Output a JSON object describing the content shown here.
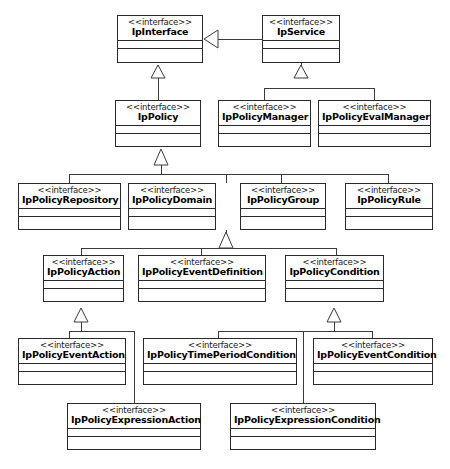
{
  "diagram": {
    "type": "uml-class-diagram",
    "stereotype_label": "<<interface>>",
    "line_color": "#3a3a3a",
    "fill_color": "#ffffff",
    "text_color": "#000000"
  },
  "classes": [
    {
      "id": "IpInterface",
      "name": "IpInterface",
      "stereotype": "<<interface>>",
      "x": 117,
      "y": 15,
      "w": 86,
      "h": 48
    },
    {
      "id": "IpService",
      "name": "IpService",
      "stereotype": "<<interface>>",
      "x": 262,
      "y": 15,
      "w": 78,
      "h": 48
    },
    {
      "id": "IpPolicy",
      "name": "IpPolicy",
      "stereotype": "<<interface>>",
      "x": 115,
      "y": 100,
      "w": 86,
      "h": 47
    },
    {
      "id": "IpPolicyManager",
      "name": "IpPolicyManager",
      "stereotype": "<<interface>>",
      "x": 218,
      "y": 100,
      "w": 93,
      "h": 47
    },
    {
      "id": "IpPolicyEvalManager",
      "name": "IpPolicyEvalManager",
      "stereotype": "<<interface>>",
      "x": 318,
      "y": 100,
      "w": 113,
      "h": 47
    },
    {
      "id": "IpPolicyRepository",
      "name": "IpPolicyRepository",
      "stereotype": "<<interface>>",
      "x": 18,
      "y": 183,
      "w": 103,
      "h": 47
    },
    {
      "id": "IpPolicyDomain",
      "name": "IpPolicyDomain",
      "stereotype": "<<interface>>",
      "x": 128,
      "y": 183,
      "w": 88,
      "h": 47
    },
    {
      "id": "IpPolicyGroup",
      "name": "IpPolicyGroup",
      "stereotype": "<<interface>>",
      "x": 240,
      "y": 183,
      "w": 86,
      "h": 47
    },
    {
      "id": "IpPolicyRule",
      "name": "IpPolicyRule",
      "stereotype": "<<interface>>",
      "x": 345,
      "y": 183,
      "w": 88,
      "h": 47
    },
    {
      "id": "IpPolicyAction",
      "name": "IpPolicyAction",
      "stereotype": "<<interface>>",
      "x": 43,
      "y": 255,
      "w": 81,
      "h": 47
    },
    {
      "id": "IpPolicyEventDefinition",
      "name": "IpPolicyEventDefinition",
      "stereotype": "<<interface>>",
      "x": 138,
      "y": 255,
      "w": 128,
      "h": 47
    },
    {
      "id": "IpPolicyCondition",
      "name": "IpPolicyCondition",
      "stereotype": "<<interface>>",
      "x": 285,
      "y": 255,
      "w": 99,
      "h": 47
    },
    {
      "id": "IpPolicyEventAction",
      "name": "IpPolicyEventAction",
      "stereotype": "<<interface>>",
      "x": 18,
      "y": 338,
      "w": 108,
      "h": 47
    },
    {
      "id": "IpPolicyTimePeriodCondition",
      "name": "IpPolicyTimePeriodCondition",
      "stereotype": "<<interface>>",
      "x": 143,
      "y": 338,
      "w": 154,
      "h": 47
    },
    {
      "id": "IpPolicyEventCondition",
      "name": "IpPolicyEventCondition",
      "stereotype": "<<interface>>",
      "x": 313,
      "y": 338,
      "w": 120,
      "h": 47
    },
    {
      "id": "IpPolicyExpressionAction",
      "name": "IpPolicyExpressionAction",
      "stereotype": "<<interface>>",
      "x": 67,
      "y": 403,
      "w": 134,
      "h": 47
    },
    {
      "id": "IpPolicyExpressionCondition",
      "name": "IpPolicyExpressionCondition",
      "stereotype": "<<interface>>",
      "x": 230,
      "y": 403,
      "w": 146,
      "h": 47
    }
  ],
  "generalizations": [
    {
      "from": "IpService",
      "to": "IpInterface",
      "kind": "generalization"
    },
    {
      "from": "IpPolicy",
      "to": "IpInterface",
      "kind": "generalization"
    },
    {
      "from": "IpPolicyManager",
      "to": "IpService",
      "kind": "generalization"
    },
    {
      "from": "IpPolicyEvalManager",
      "to": "IpService",
      "kind": "generalization"
    },
    {
      "from": "IpPolicyRepository",
      "to": "IpPolicy",
      "kind": "generalization"
    },
    {
      "from": "IpPolicyDomain",
      "to": "IpPolicy",
      "kind": "generalization"
    },
    {
      "from": "IpPolicyGroup",
      "to": "IpPolicy",
      "kind": "generalization"
    },
    {
      "from": "IpPolicyRule",
      "to": "IpPolicy",
      "kind": "generalization"
    },
    {
      "from": "IpPolicyAction",
      "to": "IpPolicyDomain",
      "kind": "generalization"
    },
    {
      "from": "IpPolicyEventDefinition",
      "to": "IpPolicyDomain",
      "kind": "generalization"
    },
    {
      "from": "IpPolicyCondition",
      "to": "IpPolicyDomain",
      "kind": "generalization"
    },
    {
      "from": "IpPolicyEventAction",
      "to": "IpPolicyAction",
      "kind": "generalization"
    },
    {
      "from": "IpPolicyExpressionAction",
      "to": "IpPolicyAction",
      "kind": "generalization"
    },
    {
      "from": "IpPolicyTimePeriodCondition",
      "to": "IpPolicyCondition",
      "kind": "generalization"
    },
    {
      "from": "IpPolicyEventCondition",
      "to": "IpPolicyCondition",
      "kind": "generalization"
    },
    {
      "from": "IpPolicyExpressionCondition",
      "to": "IpPolicyCondition",
      "kind": "generalization"
    }
  ]
}
